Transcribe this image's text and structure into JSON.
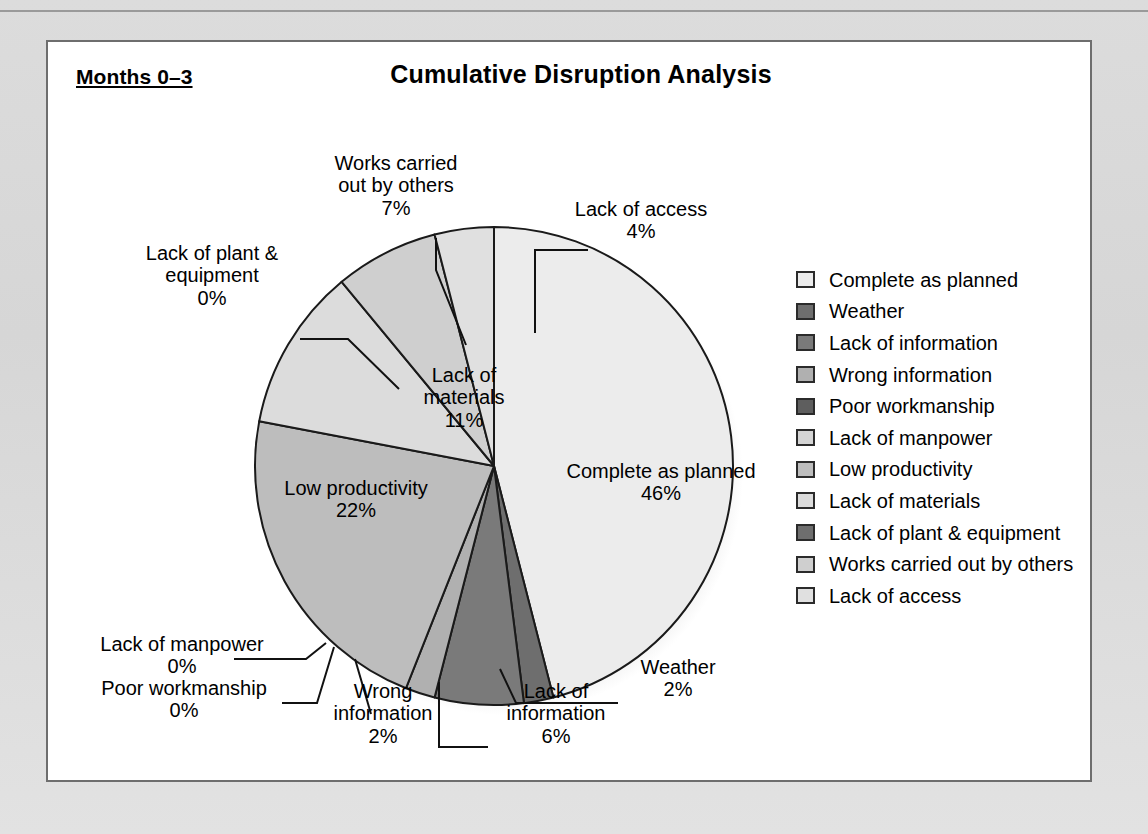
{
  "panel": {
    "period_label": "Months 0–3",
    "title": "Cumulative Disruption Analysis"
  },
  "chart_data": {
    "type": "pie",
    "title": "Cumulative Disruption Analysis",
    "subtitle": "Months 0–3",
    "legend_position": "right",
    "unit": "percent",
    "categories": [
      "Complete as planned",
      "Weather",
      "Lack of information",
      "Wrong information",
      "Poor workmanship",
      "Lack of manpower",
      "Low productivity",
      "Lack of materials",
      "Lack of plant & equipment",
      "Works carried out by others",
      "Lack of access"
    ],
    "values": [
      46,
      2,
      6,
      2,
      0,
      0,
      22,
      11,
      0,
      7,
      4
    ],
    "value_labels": [
      "46%",
      "2%",
      "6%",
      "2%",
      "0%",
      "0%",
      "22%",
      "11%",
      "0%",
      "7%",
      "4%"
    ],
    "colors": [
      "#ececec",
      "#6e6e6e",
      "#7a7a7a",
      "#b0b0b0",
      "#5e5e5e",
      "#d4d4d4",
      "#bdbdbd",
      "#dcdcdc",
      "#6e6e6e",
      "#cfcfcf",
      "#e0e0e0"
    ],
    "slice_edge_color": "#1a1a1a",
    "start_angle_deg": 0,
    "direction": "clockwise"
  },
  "legend": {
    "items": [
      {
        "label": "Complete as planned",
        "color": "#ececec"
      },
      {
        "label": "Weather",
        "color": "#6e6e6e"
      },
      {
        "label": "Lack of information",
        "color": "#7a7a7a"
      },
      {
        "label": "Wrong information",
        "color": "#b0b0b0"
      },
      {
        "label": "Poor workmanship",
        "color": "#5e5e5e"
      },
      {
        "label": "Lack of manpower",
        "color": "#d4d4d4"
      },
      {
        "label": "Low productivity",
        "color": "#bdbdbd"
      },
      {
        "label": "Lack of materials",
        "color": "#dcdcdc"
      },
      {
        "label": "Lack of plant & equipment",
        "color": "#6e6e6e"
      },
      {
        "label": "Works carried out by others",
        "color": "#cfcfcf"
      },
      {
        "label": "Lack of access",
        "color": "#e0e0e0"
      }
    ]
  },
  "callouts": {
    "complete_as_planned": "Complete as planned\n46%",
    "lack_of_access": "Lack of access\n4%",
    "works_carried_out_by_others": "Works carried\nout by others\n7%",
    "lack_of_plant_equipment": "Lack of plant &\nequipment\n0%",
    "lack_of_materials": "Lack of\nmaterials\n11%",
    "low_productivity": "Low productivity\n22%",
    "lack_of_manpower": "Lack of manpower\n0%",
    "poor_workmanship": "Poor workmanship\n0%",
    "wrong_information": "Wrong\ninformation\n2%",
    "lack_of_information": "Lack of\ninformation\n6%",
    "weather": "Weather\n2%"
  }
}
